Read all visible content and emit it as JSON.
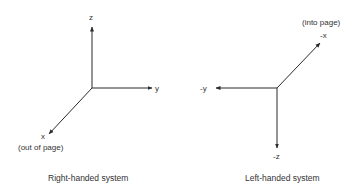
{
  "right_handed": {
    "caption": "Right-handed system",
    "axes": [
      {
        "name": "z",
        "label": "z",
        "direction": "up"
      },
      {
        "name": "y",
        "label": "y",
        "direction": "right"
      },
      {
        "name": "x",
        "label": "x",
        "direction": "down-left",
        "note": "(out of page)"
      }
    ]
  },
  "left_handed": {
    "caption": "Left-handed system",
    "axes": [
      {
        "name": "-x",
        "label": "-x",
        "direction": "up-right",
        "note": "(into page)"
      },
      {
        "name": "-y",
        "label": "-y",
        "direction": "left"
      },
      {
        "name": "-z",
        "label": "-z",
        "direction": "down"
      }
    ]
  },
  "colors": {
    "line": "#2a2a2a",
    "background": "#ffffff"
  }
}
